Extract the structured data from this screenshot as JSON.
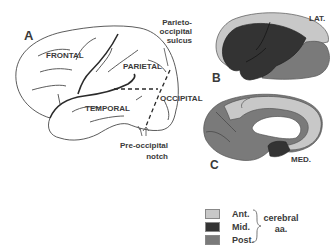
{
  "figure": {
    "panels": [
      {
        "id": "A",
        "label": "A",
        "view": "lateral outline"
      },
      {
        "id": "B",
        "label": "B",
        "view": "lateral territories",
        "side_label": "LAT."
      },
      {
        "id": "C",
        "label": "C",
        "view": "medial territories",
        "side_label": "MED."
      }
    ],
    "lobes": {
      "frontal": "FRONTAL",
      "parietal": "PARIETAL",
      "temporal": "TEMPORAL",
      "occipital": "OCCIPITAL"
    },
    "annotations": {
      "parieto_occipital_line1": "Parieto-",
      "parieto_occipital_line2": "occipital",
      "parieto_occipital_line3": "sulcus",
      "preoccipital_line1": "Pre-occipital",
      "preoccipital_line2": "notch"
    },
    "legend": {
      "items": [
        {
          "label": "Ant.",
          "color": "#c8c8c8"
        },
        {
          "label": "Mid.",
          "color": "#333333"
        },
        {
          "label": "Post.",
          "color": "#7a7a7a"
        }
      ],
      "group_line1": "cerebral",
      "group_line2": "aa."
    },
    "colors": {
      "anterior": "#c8c8c8",
      "middle": "#333333",
      "posterior": "#7a7a7a",
      "outline": "#3a3a3a"
    }
  }
}
